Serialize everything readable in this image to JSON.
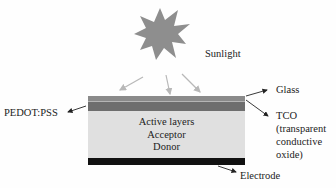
{
  "diagram": {
    "labels": {
      "sunlight": "Sunlight",
      "glass": "Glass",
      "tco": "TCO",
      "tco_desc": [
        "(transparent",
        "conductive",
        "oxide)"
      ],
      "pedot": "PEDOT:PSS",
      "electrode": "Electrode",
      "active": [
        "Active layers",
        "Acceptor",
        "Donor"
      ]
    },
    "colors": {
      "sun": "#8e8e8e",
      "glass": "#8a8a8a",
      "glass_line": "#b5b5b5",
      "tco": "#6e6e6e",
      "active": "#e0e0e0",
      "electrode": "#111111",
      "ray": "#b8b8b8"
    }
  }
}
